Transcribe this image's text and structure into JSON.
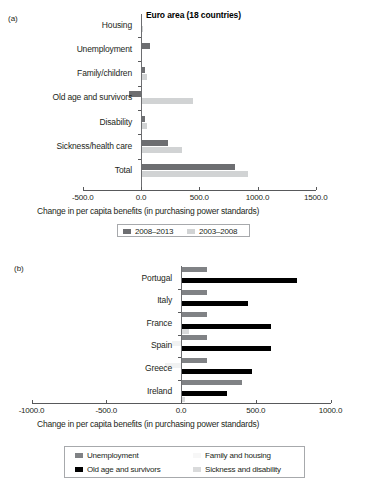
{
  "figure": {
    "panels": [
      {
        "letter": "(a)",
        "title": "Euro area (18 countries)",
        "xlabel": "Change in per capita benefits (in purchasing power standards)",
        "xticks": [
          "-500.0",
          "0.0",
          "500.0",
          "1000.0",
          "1500.0"
        ],
        "legend": [
          "2008–2013",
          "2003–2008"
        ]
      },
      {
        "letter": "(b)",
        "title": "",
        "xlabel": "Change in per capita benefits (in purchasing power standards)",
        "xticks": [
          "-1000.0",
          "-500.0",
          "0.0",
          "500.0",
          "1000.0"
        ],
        "legend": [
          "Unemployment",
          "Family and housing",
          "Old age and survivors",
          "Sickness and disability"
        ]
      }
    ]
  },
  "chart_data": [
    {
      "type": "bar",
      "orientation": "horizontal",
      "title": "Euro area (18 countries)",
      "xlabel": "Change in per capita benefits (in purchasing power standards)",
      "ylabel": "",
      "xlim": [
        -500,
        1500
      ],
      "xticks": [
        -500,
        0,
        500,
        1000,
        1500
      ],
      "xticklabels": [
        "-500.0",
        "0.0",
        "500.0",
        "1000.0",
        "1500.0"
      ],
      "grid": false,
      "legend_position": "bottom",
      "categories": [
        "Housing",
        "Unemployment",
        "Family/children",
        "Old age and survivors",
        "Disability",
        "Sickness/health care",
        "Total"
      ],
      "series": [
        {
          "name": "2008–2013",
          "color": "#6d6e71",
          "values": [
            5,
            75,
            35,
            -105,
            35,
            230,
            805
          ]
        },
        {
          "name": "2003–2008",
          "color": "#d1d3d4",
          "values": [
            18,
            5,
            50,
            450,
            55,
            350,
            920
          ]
        }
      ]
    },
    {
      "type": "bar",
      "orientation": "horizontal",
      "title": "",
      "xlabel": "Change in per capita benefits (in purchasing power standards)",
      "ylabel": "",
      "xlim": [
        -1000,
        1000
      ],
      "xticks": [
        -1000,
        -500,
        0,
        500,
        1000
      ],
      "xticklabels": [
        "-1000.0",
        "-500.0",
        "0.0",
        "500.0",
        "1000.0"
      ],
      "grid": false,
      "legend_position": "bottom",
      "categories": [
        "Portugal",
        "Italy",
        "France",
        "Spain",
        "Greece",
        "Ireland"
      ],
      "series": [
        {
          "name": "Unemployment",
          "color": "#808285",
          "values": [
            175,
            175,
            175,
            175,
            175,
            410
          ]
        },
        {
          "name": "Family and housing",
          "color": "#f1f2f2",
          "values": [
            8,
            8,
            8,
            -60,
            -110,
            8
          ]
        },
        {
          "name": "Old age and survivors",
          "color": "#000000",
          "values": [
            775,
            450,
            600,
            600,
            475,
            310
          ]
        },
        {
          "name": "Sickness and disability",
          "color": "#d9dadb",
          "values": [
            10,
            10,
            55,
            10,
            10,
            30
          ]
        }
      ]
    }
  ]
}
